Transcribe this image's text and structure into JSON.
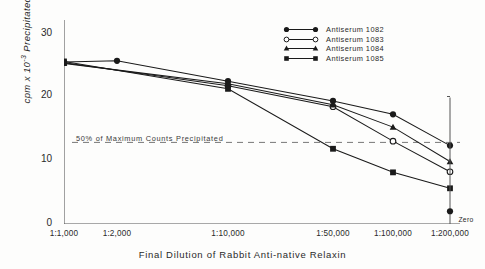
{
  "chart_data": {
    "type": "line",
    "title": "",
    "xlabel": "Final Dilution of Rabbit Anti-native Relaxin",
    "ylabel": "cpm x 10-3 Precipitated",
    "ylabel_prefix": "cpm x 10",
    "ylabel_exponent": "-3",
    "ylabel_suffix": " Precipitated",
    "categories": [
      "1:1,000",
      "1:2,000",
      "1:10,000",
      "1:50,000",
      "1:100,000",
      "1:200,000"
    ],
    "x_positions": [
      0,
      1,
      2,
      3,
      4,
      5
    ],
    "ylim": [
      0,
      32
    ],
    "yticks": [
      0,
      10,
      20,
      30
    ],
    "ytick_labels": [
      "0",
      "10",
      "20",
      "30"
    ],
    "grid": false,
    "legend_position": "top-right",
    "series": [
      {
        "name": "Antiserum 1082",
        "marker": "filled-circle",
        "color": "#1a1a1a",
        "x": [
          0,
          1,
          2,
          3,
          4,
          5
        ],
        "values": [
          25.4,
          25.6,
          22.4,
          19.3,
          17.2,
          12.3
        ]
      },
      {
        "name": "Antiserum 1083",
        "marker": "open-circle",
        "color": "#1a1a1a",
        "x": [
          0,
          2,
          3,
          4,
          5
        ],
        "values": [
          25.3,
          21.7,
          18.4,
          13.0,
          8.2
        ]
      },
      {
        "name": "Antiserum 1084",
        "marker": "filled-triangle",
        "color": "#1a1a1a",
        "x": [
          0,
          2,
          3,
          4,
          5
        ],
        "values": [
          25.2,
          22.0,
          18.7,
          15.2,
          9.8
        ]
      },
      {
        "name": "Antiserum 1085",
        "marker": "filled-square",
        "color": "#1a1a1a",
        "x": [
          0,
          2,
          3,
          4,
          5
        ],
        "values": [
          25.5,
          21.2,
          11.8,
          8.1,
          5.6
        ]
      }
    ],
    "extra_points": [
      {
        "name": "Zero",
        "label": "Zero",
        "marker": "filled-circle",
        "x_position": 5.55,
        "value": 2.0
      }
    ],
    "annotations": [
      {
        "name": "half-maximum-threshold",
        "text": "50% of Maximum Counts Precipitated",
        "value": 12.8,
        "style": "dashed-horizontal-line"
      }
    ]
  },
  "legend": {
    "entries": [
      {
        "label": "Antiserum 1082",
        "marker": "filled-circle"
      },
      {
        "label": "Antiserum 1083",
        "marker": "open-circle"
      },
      {
        "label": "Antiserum 1084",
        "marker": "filled-triangle"
      },
      {
        "label": "Antiserum 1085",
        "marker": "filled-square"
      }
    ]
  },
  "colors": {
    "ink": "#1a1a1a",
    "axis": "#555555",
    "background": "#fdfdfc",
    "threshold": "#777777"
  }
}
